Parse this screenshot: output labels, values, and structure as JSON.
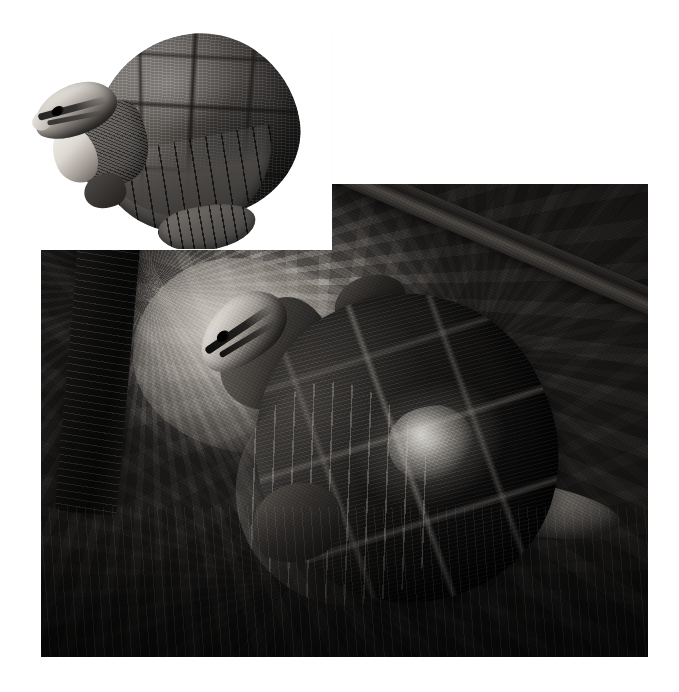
{
  "page": {
    "title": "Turtle photographic plate",
    "background_color": "#ffffff",
    "width": 679,
    "height": 692,
    "color_mode": "black-and-white",
    "layout": "two overlapping photographs; small inset plate at upper-left overlaps the larger habitat photograph"
  },
  "inset_photo": {
    "name": "Turtle specimen plate",
    "caption": "",
    "description": "Three-quarter view of a turtle with an extended neck and raised head, isolated on a plain white background",
    "background_color": "#ffffff",
    "position": {
      "x": 6,
      "y": 28,
      "width": 326,
      "height": 222
    },
    "subject": {
      "animal": "turtle",
      "view": "three-quarter front-left, head raised",
      "parts": [
        {
          "label": "carapace",
          "tone": "mid grey with dark scute seams"
        },
        {
          "label": "marginal scutes",
          "tone": "dark grey banded rim"
        },
        {
          "label": "plastron lobe",
          "tone": "dark grey"
        },
        {
          "label": "neck",
          "tone": "dark grey, finely granular"
        },
        {
          "label": "head",
          "tone": "pale cream with dark lateral stripes"
        },
        {
          "label": "eye",
          "tone": "black"
        },
        {
          "label": "beak",
          "tone": "pale cream"
        },
        {
          "label": "front foot",
          "tone": "dark grey"
        }
      ]
    }
  },
  "habitat_photo": {
    "name": "Turtle in rocky habitat",
    "caption": "",
    "description": "Overhead view of a dark-shelled turtle resting on wet rocks and gravel, head raised at upper-left, a diagonal branch crossing the upper-right corner",
    "position": {
      "x": 41,
      "y": 184,
      "width": 607,
      "height": 473
    },
    "subject": {
      "animal": "turtle",
      "view": "dorsal / overhead, head raised toward upper-left",
      "parts": [
        {
          "label": "carapace",
          "tone": "near-black with pale seam lines and a bright wet highlight"
        },
        {
          "label": "marginal scutes",
          "tone": "light grey serrated rim on lower-left"
        },
        {
          "label": "neck",
          "tone": "dark grey"
        },
        {
          "label": "head",
          "tone": "pale cream with two dark stripes"
        },
        {
          "label": "eye",
          "tone": "black"
        },
        {
          "label": "front left leg",
          "tone": "dark grey"
        },
        {
          "label": "front right leg",
          "tone": "dark grey"
        },
        {
          "label": "rear limb",
          "tone": "pale grey, extending to the right"
        }
      ]
    },
    "environment": [
      {
        "label": "vertical log",
        "position": "left edge",
        "tone": "very dark, near black"
      },
      {
        "label": "diagonal branch",
        "position": "upper-right corner",
        "tone": "dark grey cylinder"
      },
      {
        "label": "pale boulder",
        "position": "upper-middle",
        "tone": "light grey"
      },
      {
        "label": "gravel and wet rock",
        "position": "foreground / bottom",
        "tone": "dark, high-contrast speckle"
      },
      {
        "label": "shallow water sheen",
        "position": "bottom",
        "tone": "black with bright highlights"
      }
    ]
  }
}
